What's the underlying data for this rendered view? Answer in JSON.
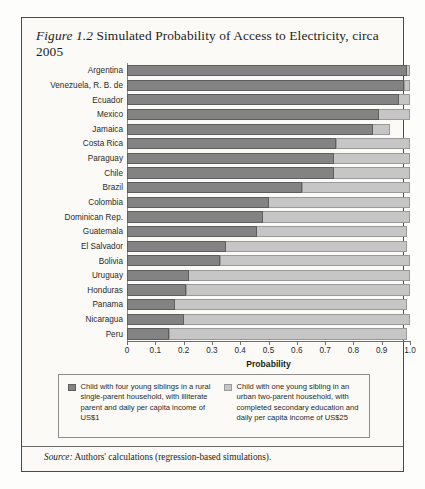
{
  "figure": {
    "number_label": "Figure 1.2",
    "title_text": " Simulated Probability of Access to Electricity, circa 2005",
    "source_label": "Source:",
    "source_text": " Authors' calculations (regression-based simulations)."
  },
  "colors": {
    "dark_series": "#838383",
    "light_series": "#c6c6c6",
    "border": "#4a4a48",
    "page_background": "#fbfaf6"
  },
  "legend": {
    "items": [
      {
        "swatch": "dark",
        "label": "Child with four young siblings in a rural single-parent household, with illiterate parent and daily per capita income of US$1"
      },
      {
        "swatch": "light",
        "label": "Child with one young sibling in an urban two-parent household, with completed secondary education and daily per capita income of US$25"
      }
    ]
  },
  "chart_data": {
    "type": "bar",
    "orientation": "horizontal",
    "stacked": true,
    "title": "Simulated Probability of Access to Electricity, circa 2005",
    "xlabel": "Probability",
    "ylabel": "",
    "xlim": [
      0,
      1.0
    ],
    "grid": false,
    "legend_position": "bottom",
    "xticks": [
      "0",
      "0.1",
      "0.2",
      "0.3",
      "0.4",
      "0.5",
      "0.6",
      "0.7",
      "0.8",
      "0.9",
      "1.0"
    ],
    "xtick_values": [
      0,
      0.1,
      0.2,
      0.3,
      0.4,
      0.5,
      0.6,
      0.7,
      0.8,
      0.9,
      1.0
    ],
    "categories": [
      "Argentina",
      "Venezuela, R. B. de",
      "Ecuador",
      "Mexico",
      "Jamaica",
      "Costa Rica",
      "Paraguay",
      "Chile",
      "Brazil",
      "Colombia",
      "Dominican Rep.",
      "Guatemala",
      "El Salvador",
      "Bolivia",
      "Uruguay",
      "Honduras",
      "Panama",
      "Nicaragua",
      "Peru"
    ],
    "series": [
      {
        "name": "Child with four young siblings in a rural single-parent household, with illiterate parent and daily per capita income of US$1",
        "color": "#838383",
        "values": [
          0.99,
          0.98,
          0.96,
          0.89,
          0.87,
          0.74,
          0.73,
          0.73,
          0.62,
          0.5,
          0.48,
          0.46,
          0.35,
          0.33,
          0.22,
          0.21,
          0.17,
          0.2,
          0.15
        ]
      },
      {
        "name": "Child with one young sibling in an urban two-parent household, with completed secondary education and daily per capita income of US$25",
        "color": "#c6c6c6",
        "values": [
          1.0,
          1.0,
          1.0,
          1.0,
          0.93,
          1.0,
          1.0,
          1.0,
          1.0,
          1.0,
          1.0,
          0.99,
          0.99,
          1.0,
          1.0,
          1.0,
          0.99,
          1.0,
          0.99
        ],
        "note": "cumulative total (bar end)"
      }
    ]
  }
}
